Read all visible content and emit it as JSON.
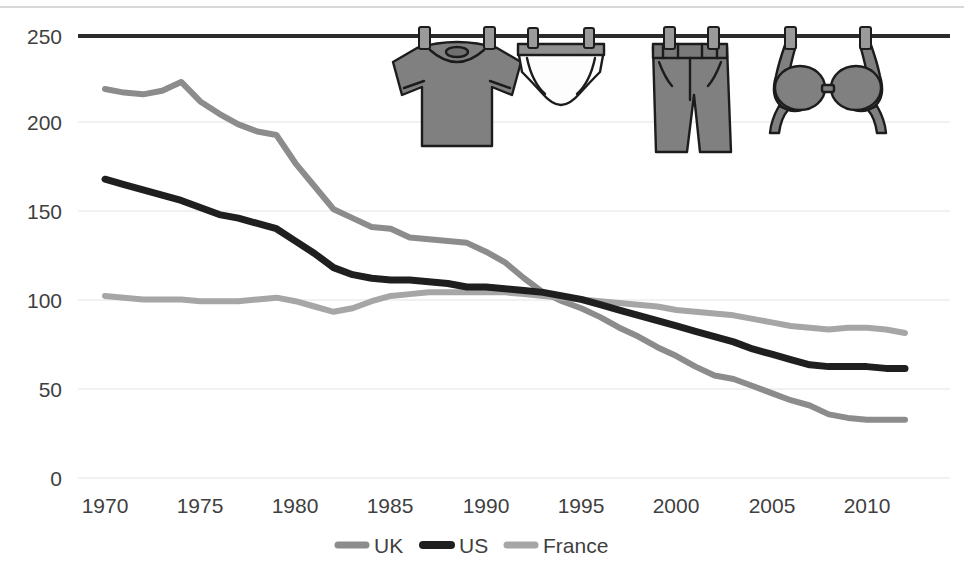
{
  "chart_data": {
    "type": "line",
    "title": "",
    "subtitle": "",
    "xlabel": "",
    "ylabel": "",
    "xlim": [
      1970,
      2012
    ],
    "ylim": [
      0,
      250
    ],
    "ytick_values": [
      0,
      50,
      100,
      150,
      200,
      250
    ],
    "ytick_labels": [
      "0",
      "50",
      "100",
      "150",
      "200",
      "250"
    ],
    "xtick_values": [
      1970,
      1975,
      1980,
      1985,
      1990,
      1995,
      2000,
      2005,
      2010
    ],
    "xtick_labels": [
      "1970",
      "1975",
      "1980",
      "1985",
      "1990",
      "1995",
      "2000",
      "2005",
      "2010"
    ],
    "grid": true,
    "legend_position": "bottom",
    "x": [
      1970,
      1971,
      1972,
      1973,
      1974,
      1975,
      1976,
      1977,
      1978,
      1979,
      1980,
      1981,
      1982,
      1983,
      1984,
      1985,
      1986,
      1987,
      1988,
      1989,
      1990,
      1991,
      1992,
      1993,
      1994,
      1995,
      1996,
      1997,
      1998,
      1999,
      2000,
      2001,
      2002,
      2003,
      2004,
      2005,
      2006,
      2007,
      2008,
      2009,
      2010,
      2011,
      2012
    ],
    "series": [
      {
        "name": "UK",
        "color": "#8c8c8c",
        "width": 6,
        "values": [
          220,
          218,
          217,
          219,
          224,
          213,
          206,
          200,
          196,
          194,
          178,
          165,
          152,
          147,
          142,
          141,
          136,
          135,
          134,
          133,
          128,
          122,
          113,
          105,
          100,
          96,
          91,
          85,
          80,
          74,
          69,
          63,
          58,
          56,
          52,
          48,
          44,
          41,
          36,
          34,
          33,
          33,
          33
        ]
      },
      {
        "name": "US",
        "color": "#1f1f1f",
        "width": 7,
        "values": [
          169,
          166,
          163,
          160,
          157,
          153,
          149,
          147,
          144,
          141,
          134,
          127,
          119,
          115,
          113,
          112,
          112,
          111,
          110,
          108,
          108,
          107,
          106,
          105,
          103,
          101,
          98,
          95,
          92,
          89,
          86,
          83,
          80,
          77,
          73,
          70,
          67,
          64,
          63,
          63,
          63,
          62,
          62
        ]
      },
      {
        "name": "France",
        "color": "#a6a6a6",
        "width": 6,
        "values": [
          103,
          102,
          101,
          101,
          101,
          100,
          100,
          100,
          101,
          102,
          100,
          97,
          94,
          96,
          100,
          103,
          104,
          105,
          105,
          105,
          105,
          105,
          104,
          103,
          102,
          101,
          100,
          99,
          98,
          97,
          95,
          94,
          93,
          92,
          90,
          88,
          86,
          85,
          84,
          85,
          85,
          84,
          82
        ]
      }
    ]
  },
  "legend": {
    "items": [
      {
        "label": "UK",
        "color": "#8c8c8c"
      },
      {
        "label": "US",
        "color": "#1f1f1f"
      },
      {
        "label": "France",
        "color": "#a6a6a6"
      }
    ]
  },
  "illustration": {
    "washing_line_label": "washing-line",
    "garments": [
      {
        "name": "t-shirt",
        "fill": "#808080"
      },
      {
        "name": "underwear-briefs",
        "fill": "#fdfdfd"
      },
      {
        "name": "jeans",
        "fill": "#808080"
      },
      {
        "name": "bra",
        "fill": "#808080"
      }
    ]
  }
}
